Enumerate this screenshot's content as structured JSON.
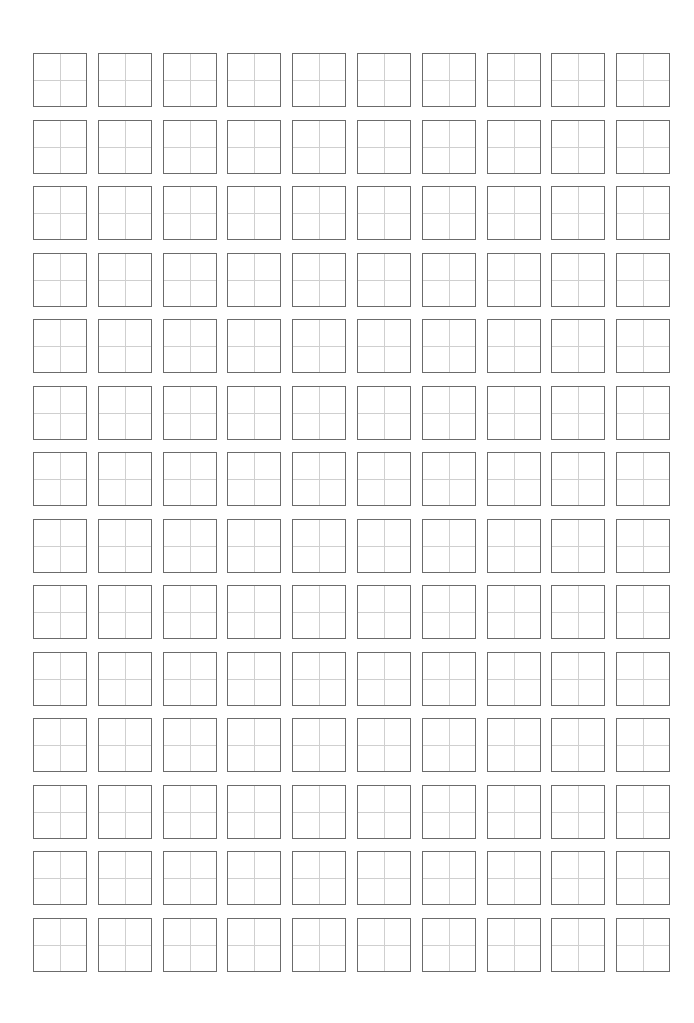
{
  "worksheet": {
    "type": "writing-practice-grid",
    "rows": 14,
    "columns": 10,
    "cell_style": "four-quadrant guide box",
    "colors": {
      "background": "#ffffff",
      "cell_border": "#6b6b6b",
      "guide_lines": "#cfcfcf"
    },
    "layout": {
      "origin_x": 33,
      "origin_y": 53,
      "cell_size": 54,
      "pitch_x": 64.8,
      "pitch_y": 66.5
    },
    "cells_text": []
  }
}
